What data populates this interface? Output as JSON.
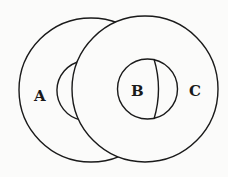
{
  "diagram": {
    "type": "venn",
    "labels": {
      "a": "A",
      "b": "B",
      "c": "C"
    },
    "colors": {
      "stroke": "#1a1a1a",
      "background": "#fbfbfa"
    }
  }
}
